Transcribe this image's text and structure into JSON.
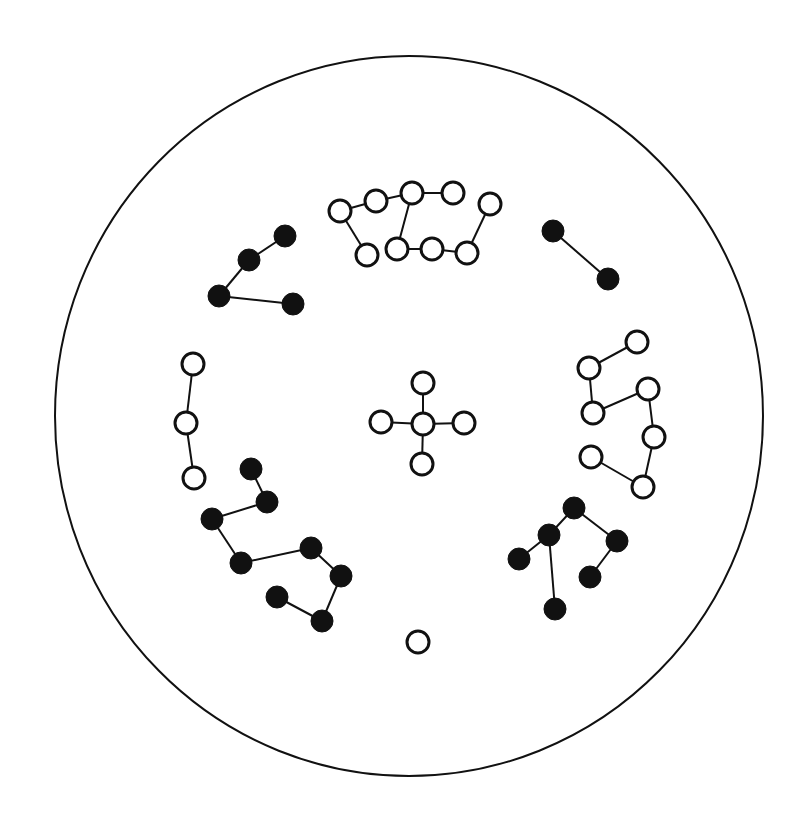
{
  "diagram": {
    "type": "molecular-cluster-diagram",
    "colors": {
      "background": "#ffffff",
      "stroke": "#111111",
      "filled": "#111111",
      "hollow": "#ffffff"
    },
    "boundary": {
      "cx": 409,
      "cy": 416,
      "rx": 354,
      "ry": 360
    },
    "node_radius": 11,
    "clusters": [
      {
        "name": "top-white-chain",
        "fill": "hollow",
        "nodes": [
          [
            340,
            211
          ],
          [
            376,
            201
          ],
          [
            412,
            193
          ],
          [
            453,
            193
          ],
          [
            490,
            204
          ],
          [
            367,
            255
          ],
          [
            397,
            249
          ],
          [
            432,
            249
          ],
          [
            467,
            253
          ]
        ],
        "edges": [
          [
            0,
            1
          ],
          [
            1,
            2
          ],
          [
            2,
            3
          ],
          [
            0,
            5
          ],
          [
            2,
            6
          ],
          [
            6,
            7
          ],
          [
            7,
            8
          ],
          [
            8,
            4
          ]
        ]
      },
      {
        "name": "upper-left-black-chain",
        "fill": "filled",
        "nodes": [
          [
            285,
            236
          ],
          [
            249,
            260
          ],
          [
            219,
            296
          ],
          [
            293,
            304
          ]
        ],
        "edges": [
          [
            0,
            1
          ],
          [
            1,
            2
          ],
          [
            2,
            3
          ]
        ]
      },
      {
        "name": "upper-right-black-pair",
        "fill": "filled",
        "nodes": [
          [
            553,
            231
          ],
          [
            608,
            279
          ]
        ],
        "edges": [
          [
            0,
            1
          ]
        ]
      },
      {
        "name": "right-white-chain",
        "fill": "hollow",
        "nodes": [
          [
            637,
            342
          ],
          [
            589,
            368
          ],
          [
            593,
            413
          ],
          [
            648,
            389
          ],
          [
            654,
            437
          ],
          [
            643,
            487
          ],
          [
            591,
            457
          ]
        ],
        "edges": [
          [
            0,
            1
          ],
          [
            1,
            2
          ],
          [
            2,
            3
          ],
          [
            3,
            4
          ],
          [
            4,
            5
          ],
          [
            5,
            6
          ]
        ]
      },
      {
        "name": "left-white-chain",
        "fill": "hollow",
        "nodes": [
          [
            193,
            364
          ],
          [
            186,
            423
          ],
          [
            194,
            478
          ]
        ],
        "edges": [
          [
            0,
            1
          ],
          [
            1,
            2
          ]
        ]
      },
      {
        "name": "center-white-cross",
        "fill": "hollow",
        "nodes": [
          [
            423,
            424
          ],
          [
            423,
            383
          ],
          [
            381,
            422
          ],
          [
            464,
            423
          ],
          [
            422,
            464
          ]
        ],
        "edges": [
          [
            0,
            1
          ],
          [
            0,
            2
          ],
          [
            0,
            3
          ],
          [
            0,
            4
          ]
        ]
      },
      {
        "name": "lower-left-black-chain",
        "fill": "filled",
        "nodes": [
          [
            251,
            469
          ],
          [
            267,
            502
          ],
          [
            212,
            519
          ],
          [
            241,
            563
          ],
          [
            311,
            548
          ],
          [
            341,
            576
          ],
          [
            322,
            621
          ],
          [
            277,
            597
          ]
        ],
        "edges": [
          [
            0,
            1
          ],
          [
            1,
            2
          ],
          [
            2,
            3
          ],
          [
            3,
            4
          ],
          [
            4,
            5
          ],
          [
            5,
            6
          ],
          [
            6,
            7
          ]
        ]
      },
      {
        "name": "lower-right-black-tree",
        "fill": "filled",
        "nodes": [
          [
            574,
            508
          ],
          [
            549,
            535
          ],
          [
            519,
            559
          ],
          [
            555,
            609
          ],
          [
            617,
            541
          ],
          [
            590,
            577
          ]
        ],
        "edges": [
          [
            0,
            1
          ],
          [
            1,
            2
          ],
          [
            1,
            3
          ],
          [
            0,
            4
          ],
          [
            4,
            5
          ]
        ]
      },
      {
        "name": "bottom-white-single",
        "fill": "hollow",
        "nodes": [
          [
            418,
            642
          ]
        ],
        "edges": []
      }
    ]
  }
}
